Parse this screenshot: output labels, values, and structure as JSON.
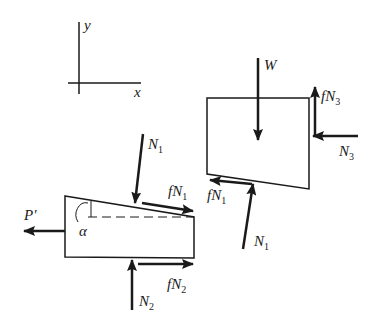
{
  "diagram": {
    "type": "free-body diagram",
    "stroke_color": "#1a1a1a",
    "background": "#ffffff",
    "axes": {
      "x_label": "x",
      "y_label": "y"
    },
    "wedge": {
      "angle_label": "α",
      "forces": {
        "P": {
          "symbol": "P′",
          "direction": "left"
        },
        "N1": {
          "symbol": "N",
          "sub": "1",
          "direction": "down-onto-sloped-top"
        },
        "fN1": {
          "symbol": "fN",
          "sub": "1",
          "direction": "along-slope-right"
        },
        "N2": {
          "symbol": "N",
          "sub": "2",
          "direction": "up"
        },
        "fN2": {
          "symbol": "fN",
          "sub": "2",
          "direction": "right"
        }
      }
    },
    "block": {
      "forces": {
        "W": {
          "symbol": "W",
          "direction": "down"
        },
        "fN3": {
          "symbol": "fN",
          "sub": "3",
          "direction": "up"
        },
        "N3": {
          "symbol": "N",
          "sub": "3",
          "direction": "left"
        },
        "fN1": {
          "symbol": "fN",
          "sub": "1",
          "direction": "along-slope-left"
        },
        "N1": {
          "symbol": "N",
          "sub": "1",
          "direction": "up-onto-sloped-bottom"
        }
      }
    }
  }
}
